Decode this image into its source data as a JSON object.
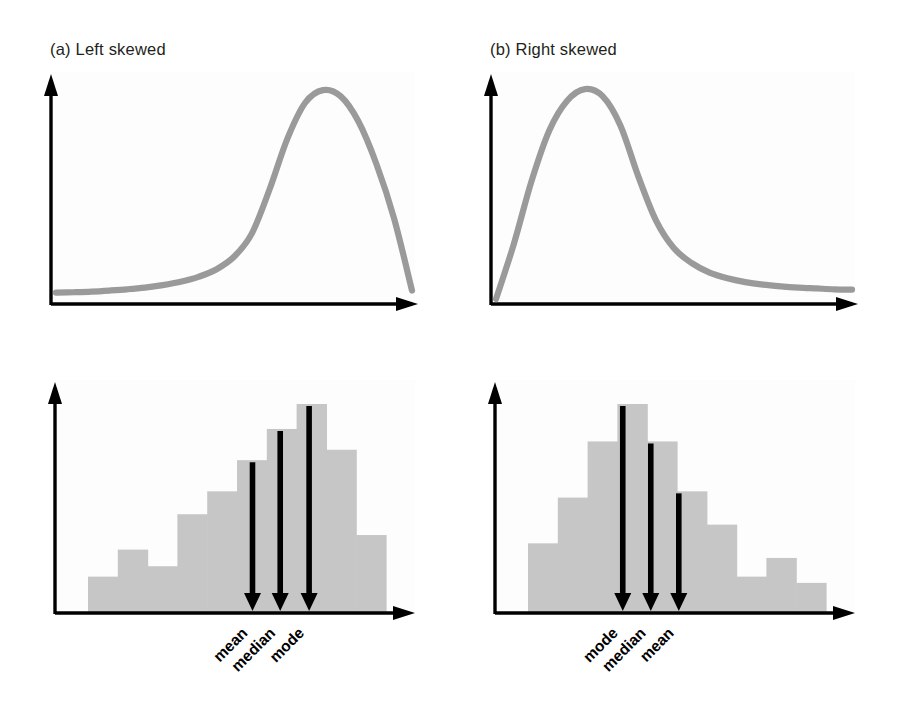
{
  "figure": {
    "background_color": "#ffffff",
    "curve_color": "#9a9a9a",
    "bar_color": "#c6c6c6",
    "axis_color": "#000000",
    "label_color": "#000000",
    "title_color": "#231f20"
  },
  "panels": {
    "a": {
      "title": "(a) Left skewed",
      "top_caption": "(a) Left skewed"
    },
    "b": {
      "title": "(b) Right skewed",
      "top_caption": "(b) Right skewed"
    }
  },
  "markers": {
    "left_skewed_order": [
      "mean",
      "median",
      "mode"
    ],
    "right_skewed_order": [
      "mode",
      "median",
      "mean"
    ],
    "left": [
      {
        "label": "mean",
        "x_frac": 0.552
      },
      {
        "label": "median",
        "x_frac": 0.645
      },
      {
        "label": "mode",
        "x_frac": 0.742
      }
    ],
    "right": [
      {
        "label": "mode",
        "x_frac": 0.318
      },
      {
        "label": "median",
        "x_frac": 0.412
      },
      {
        "label": "mean",
        "x_frac": 0.506
      }
    ]
  },
  "chart_data": [
    {
      "id": "left-skewed-density",
      "type": "line",
      "title": "(a) Left skewed",
      "xlabel": "",
      "ylabel": "",
      "grid": false,
      "legend": "none",
      "xlim": [
        0,
        1
      ],
      "ylim": [
        0,
        1
      ],
      "description": "Smooth left-skewed (negatively skewed) density curve: long flat tail on the left, sharp peak near the right.",
      "x": [
        0.0,
        0.05,
        0.1,
        0.15,
        0.2,
        0.25,
        0.3,
        0.35,
        0.4,
        0.45,
        0.5,
        0.55,
        0.6,
        0.65,
        0.7,
        0.75,
        0.8,
        0.85,
        0.9,
        0.95,
        1.0
      ],
      "y": [
        0.03,
        0.032,
        0.035,
        0.04,
        0.046,
        0.054,
        0.066,
        0.082,
        0.105,
        0.14,
        0.2,
        0.31,
        0.52,
        0.76,
        0.93,
        0.99,
        0.96,
        0.84,
        0.64,
        0.38,
        0.04
      ]
    },
    {
      "id": "right-skewed-density",
      "type": "line",
      "title": "(b) Right skewed",
      "xlabel": "",
      "ylabel": "",
      "grid": false,
      "legend": "none",
      "xlim": [
        0,
        1
      ],
      "ylim": [
        0,
        1
      ],
      "description": "Smooth right-skewed (positively skewed) density curve: sharp peak near the left, long flat tail to the right.",
      "x": [
        0.0,
        0.05,
        0.1,
        0.15,
        0.2,
        0.25,
        0.3,
        0.35,
        0.4,
        0.45,
        0.5,
        0.55,
        0.6,
        0.65,
        0.7,
        0.75,
        0.8,
        0.85,
        0.9,
        0.95,
        1.0
      ],
      "y": [
        0.0,
        0.26,
        0.56,
        0.8,
        0.94,
        0.995,
        0.96,
        0.82,
        0.58,
        0.37,
        0.24,
        0.17,
        0.125,
        0.098,
        0.08,
        0.068,
        0.06,
        0.054,
        0.05,
        0.046,
        0.044
      ]
    },
    {
      "id": "left-skewed-histogram",
      "type": "bar",
      "title": "",
      "xlabel": "",
      "ylabel": "",
      "grid": false,
      "legend": "none",
      "ylim": [
        0,
        1
      ],
      "description": "Left-skewed histogram with 10 bins; mean < median < mode marked by downward arrows.",
      "categories": [
        "1",
        "2",
        "3",
        "4",
        "5",
        "6",
        "7",
        "8",
        "9",
        "10"
      ],
      "values": [
        0.17,
        0.3,
        0.22,
        0.47,
        0.58,
        0.73,
        0.88,
        1.0,
        0.78,
        0.37
      ]
    },
    {
      "id": "right-skewed-histogram",
      "type": "bar",
      "title": "",
      "xlabel": "",
      "ylabel": "",
      "grid": false,
      "legend": "none",
      "ylim": [
        0,
        1
      ],
      "description": "Right-skewed histogram with 10 bins; mode < median < mean marked by downward arrows.",
      "categories": [
        "1",
        "2",
        "3",
        "4",
        "5",
        "6",
        "7",
        "8",
        "9",
        "10"
      ],
      "values": [
        0.33,
        0.55,
        0.82,
        1.0,
        0.82,
        0.58,
        0.42,
        0.17,
        0.26,
        0.14
      ]
    }
  ]
}
